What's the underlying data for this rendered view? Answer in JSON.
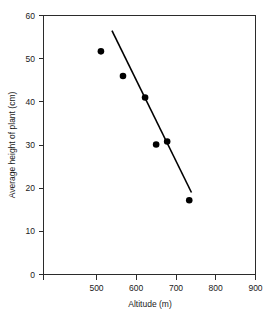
{
  "chart_data": {
    "type": "scatter",
    "title": "",
    "xlabel": "Altitude (m)",
    "ylabel": "Average height of plant (cm)",
    "xlim": [
      420,
      900
    ],
    "ylim": [
      0,
      60
    ],
    "xticks": [
      500,
      600,
      700,
      800,
      900
    ],
    "yticks": [
      0,
      10,
      20,
      30,
      40,
      50,
      60
    ],
    "xtick_labels": [
      "500",
      "600",
      "700",
      "800",
      "900"
    ],
    "ytick_labels": [
      "0",
      "10",
      "20",
      "30",
      "40",
      "50",
      "60"
    ],
    "grid": false,
    "legend": false,
    "marker": "filled-circle",
    "marker_color": "#000000",
    "line_color": "#000000",
    "axis_color": "#2b2b2b",
    "background": "#ffffff",
    "points": [
      {
        "x": 550,
        "y": 51.7
      },
      {
        "x": 600,
        "y": 46.0
      },
      {
        "x": 650,
        "y": 41.0
      },
      {
        "x": 675,
        "y": 30.1
      },
      {
        "x": 700,
        "y": 30.8
      },
      {
        "x": 750,
        "y": 17.2
      }
    ],
    "series": [
      {
        "name": "Average plant height vs altitude",
        "x": [
          550,
          600,
          650,
          675,
          700,
          750
        ],
        "values": [
          51.7,
          46.0,
          41.0,
          30.1,
          30.8,
          17.2
        ]
      }
    ],
    "trend_line": {
      "type": "best-fit-straight-line",
      "x_start": 575,
      "y_start": 56.5,
      "x_end": 755,
      "y_end": 19.0
    }
  },
  "axis_labels": {
    "x": "Altitude (m)",
    "y": "Average height of plant (cm)"
  }
}
